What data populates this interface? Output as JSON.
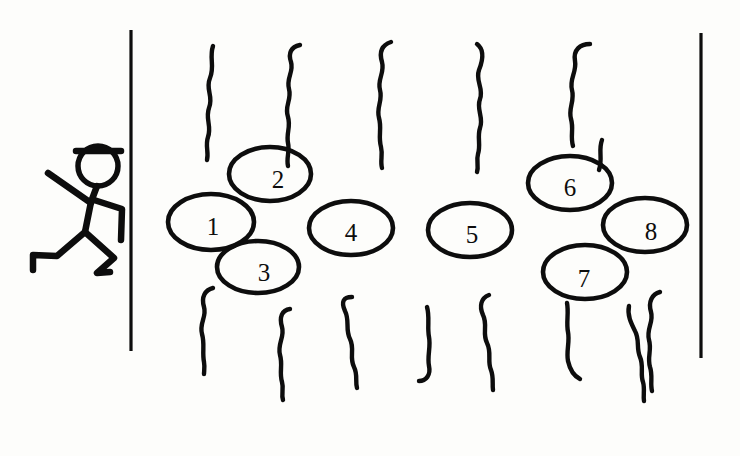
{
  "scene": {
    "title": "Hand-drawn stick figure beside numbered oval stepping stones in tall grass",
    "width": 740,
    "height": 456,
    "background_color": "#fdfdfb",
    "ink_color": "#0d0d0d"
  },
  "walls": [
    {
      "name": "left-wall",
      "x": 131,
      "y_top": 30,
      "y_bottom": 351
    },
    {
      "name": "right-wall",
      "x": 701,
      "y_top": 33,
      "y_bottom": 358
    }
  ],
  "figure": {
    "name": "stick-figure-person",
    "head_center_x": 98,
    "head_center_y": 166,
    "head_radius": 20,
    "has_cap": true
  },
  "ellipses": [
    {
      "label": "1",
      "cx": 211,
      "cy": 222,
      "rx": 43,
      "ry": 28,
      "label_dx": 2,
      "label_dy": 7
    },
    {
      "label": "2",
      "cx": 270,
      "cy": 174,
      "rx": 41,
      "ry": 27,
      "label_dx": 8,
      "label_dy": 8
    },
    {
      "label": "3",
      "cx": 258,
      "cy": 267,
      "rx": 41,
      "ry": 26,
      "label_dx": 6,
      "label_dy": 8
    },
    {
      "label": "4",
      "cx": 351,
      "cy": 228,
      "rx": 42,
      "ry": 27,
      "label_dx": 0,
      "label_dy": 7
    },
    {
      "label": "5",
      "cx": 470,
      "cy": 230,
      "rx": 42,
      "ry": 27,
      "label_dx": 2,
      "label_dy": 7
    },
    {
      "label": "6",
      "cx": 570,
      "cy": 183,
      "rx": 42,
      "ry": 27,
      "label_dx": 0,
      "label_dy": 7
    },
    {
      "label": "7",
      "cx": 585,
      "cy": 272,
      "rx": 42,
      "ry": 27,
      "label_dx": -1,
      "label_dy": 9
    },
    {
      "label": "8",
      "cx": 645,
      "cy": 225,
      "rx": 42,
      "ry": 27,
      "label_dx": 6,
      "label_dy": 9
    }
  ],
  "squiggles_top": [
    {
      "name": "grass-top-1",
      "path": "M 213 46 C 209 58 215 66 210 78 C 205 90 214 96 209 108 C 205 119 212 126 208 137 C 205 146 209 152 207 160"
    },
    {
      "name": "grass-top-2",
      "path": "M 300 45 C 291 47 288 53 291 62 C 294 72 286 78 289 89 C 292 100 284 106 288 117 C 291 127 286 133 288 143 C 290 152 286 158 288 166"
    },
    {
      "name": "grass-top-3",
      "path": "M 391 42 C 382 45 379 52 382 62 C 385 73 377 79 380 90 C 383 101 376 107 379 118 C 382 128 378 136 381 147 C 383 155 380 161 382 168"
    },
    {
      "name": "grass-top-4",
      "path": "M 477 44 C 485 50 483 60 479 70 C 475 81 484 88 480 99 C 476 110 484 117 480 128 C 477 137 481 145 478 154 C 476 161 479 166 477 172"
    },
    {
      "name": "grass-top-5",
      "path": "M 590 44 C 580 44 573 50 575 61 C 577 72 569 79 572 90 C 575 101 568 108 571 119 C 574 129 570 136 573 146"
    },
    {
      "name": "grass-top-6",
      "path": "M 599 170 C 603 159 598 150 602 140"
    }
  ],
  "squiggles_bottom": [
    {
      "name": "grass-bottom-1",
      "path": "M 213 288 C 205 290 201 297 204 307 C 207 317 199 323 202 334 C 205 344 202 352 204 362 C 205 368 204 371 204 374"
    },
    {
      "name": "grass-bottom-2",
      "path": "M 290 309 C 282 310 279 317 282 327 C 285 337 277 344 280 355 C 283 365 279 372 282 382 C 284 389 281 394 283 400"
    },
    {
      "name": "grass-bottom-3",
      "path": "M 352 297 C 343 297 341 302 345 311 C 350 321 345 329 350 339 C 355 349 349 357 354 367 C 358 375 355 381 357 388"
    },
    {
      "name": "grass-bottom-4",
      "path": "M 427 307 C 430 317 427 327 429 337 C 431 347 427 356 429 366 C 431 375 426 381 419 381"
    },
    {
      "name": "grass-bottom-5",
      "path": "M 489 295 C 481 298 479 306 483 315 C 488 325 482 333 487 343 C 492 353 487 361 491 370 C 494 378 492 384 493 390"
    },
    {
      "name": "grass-bottom-6",
      "path": "M 567 303 C 569 313 566 322 568 332 C 570 342 566 351 568 361 C 570 370 574 376 580 379"
    },
    {
      "name": "grass-bottom-7",
      "path": "M 629 306 C 627 315 631 323 635 331 C 640 340 636 348 640 357 C 644 366 640 374 643 382 C 645 389 643 395 644 401"
    },
    {
      "name": "grass-bottom-8",
      "path": "M 660 292 C 652 294 648 302 651 312 C 654 322 646 329 649 340 C 652 350 647 357 650 367 C 653 376 650 383 652 391"
    }
  ]
}
